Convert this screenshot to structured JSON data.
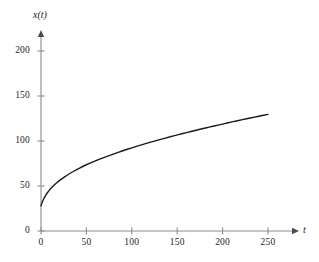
{
  "chart_data": {
    "type": "line",
    "title": "",
    "subtitle": "",
    "xlabel": "t",
    "ylabel": "x(t)",
    "xlim": [
      0,
      275
    ],
    "ylim": [
      0,
      215
    ],
    "grid": false,
    "legend": null,
    "xticks": [
      0,
      50,
      100,
      150,
      200,
      250
    ],
    "xtick_labels": [
      "0",
      "50",
      "100",
      "150",
      "200",
      "250"
    ],
    "yticks": [
      0,
      50,
      100,
      150,
      200
    ],
    "ytick_labels": [
      "0",
      "50",
      "100",
      "150",
      "200"
    ],
    "series": [
      {
        "name": "x(t)",
        "color": "#1a1a1a",
        "linewidth": 1.4,
        "x": [
          0,
          2,
          4,
          6,
          8,
          10,
          14,
          18,
          22,
          26,
          30,
          36,
          42,
          50,
          58,
          66,
          75,
          85,
          95,
          105,
          115,
          125,
          135,
          145,
          155,
          165,
          175,
          185,
          195,
          205,
          215,
          225,
          235,
          245,
          250
        ],
        "y": [
          28,
          33.5,
          37.5,
          41,
          43.8,
          46.3,
          50.5,
          54.1,
          57.3,
          60.2,
          62.8,
          66.4,
          69.7,
          73.6,
          77.1,
          80.4,
          83.8,
          87.4,
          90.8,
          94.0,
          97.0,
          99.9,
          102.7,
          105.4,
          108.0,
          110.5,
          113.0,
          115.4,
          117.7,
          120.0,
          122.2,
          124.4,
          126.5,
          128.6,
          129.6
        ]
      }
    ],
    "axis_style": {
      "arrow_on_x": true,
      "arrow_on_y": true,
      "axis_color": "#8c8c8c",
      "spine_color": "#8c8c8c"
    },
    "annotations": []
  },
  "plot_geometry": {
    "origin_x_px": 41,
    "origin_y_px": 231,
    "x_unit_px_per_50": 45.4,
    "y_unit_px_per_50": 45.0,
    "y_axis_top_px": 33,
    "x_axis_right_px": 296
  },
  "axis_labels": {
    "y_axis_name": "x(t)",
    "x_axis_name": "t"
  }
}
